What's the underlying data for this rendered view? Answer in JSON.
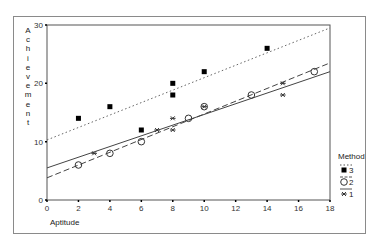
{
  "chart_data": {
    "type": "scatter",
    "title": "",
    "xlabel": "Aptitude",
    "ylabel": "Achievement",
    "xlim": [
      0,
      18
    ],
    "ylim": [
      0,
      30
    ],
    "xticks": [
      0,
      2,
      4,
      6,
      8,
      10,
      12,
      14,
      16,
      18
    ],
    "yticks": [
      0,
      10,
      20,
      30
    ],
    "grid": false,
    "legend": {
      "title": "Method",
      "position": "right-bottom",
      "entries": [
        "3",
        "2",
        "1"
      ]
    },
    "series": [
      {
        "name": "3",
        "marker": "filled-square",
        "line_style": "dotted",
        "color": "#000000",
        "points": [
          [
            2,
            14
          ],
          [
            4,
            16
          ],
          [
            6,
            12
          ],
          [
            8,
            18
          ],
          [
            8,
            20
          ],
          [
            10,
            22
          ],
          [
            14,
            26
          ]
        ],
        "fit_line": [
          [
            0,
            10.3
          ],
          [
            18,
            29.5
          ]
        ]
      },
      {
        "name": "2",
        "marker": "open-circle",
        "line_style": "dashed",
        "color": "#000000",
        "points": [
          [
            2,
            6
          ],
          [
            4,
            8
          ],
          [
            6,
            10
          ],
          [
            9,
            14
          ],
          [
            10,
            16
          ],
          [
            13,
            18
          ],
          [
            17,
            22
          ]
        ],
        "fit_line": [
          [
            0,
            3.8
          ],
          [
            18,
            23.5
          ]
        ]
      },
      {
        "name": "1",
        "marker": "asterisk",
        "line_style": "solid",
        "color": "#000000",
        "points": [
          [
            3,
            8
          ],
          [
            7,
            12
          ],
          [
            8,
            12
          ],
          [
            8,
            14
          ],
          [
            10,
            16
          ],
          [
            15,
            18
          ],
          [
            15,
            20
          ]
        ],
        "fit_line": [
          [
            0,
            5.5
          ],
          [
            18,
            22
          ]
        ]
      }
    ]
  }
}
